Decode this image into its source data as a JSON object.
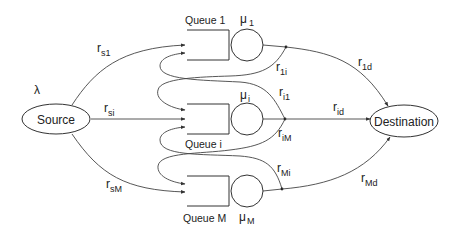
{
  "diagram": {
    "type": "queueing-network",
    "arrival_rate": {
      "symbol": "λ"
    },
    "nodes": {
      "source": {
        "label": "Source"
      },
      "destination": {
        "label": "Destination"
      }
    },
    "queues": [
      {
        "id": "1",
        "label": "Queue 1",
        "service_symbol": "μ",
        "service_sub": "1"
      },
      {
        "id": "i",
        "label": "Queue i",
        "service_symbol": "μ",
        "service_sub": "i"
      },
      {
        "id": "M",
        "label": "Queue M",
        "service_symbol": "μ",
        "service_sub": "M"
      }
    ],
    "edges": [
      {
        "from": "Source",
        "to": "Queue 1",
        "symbol": "r",
        "sub": "s1"
      },
      {
        "from": "Source",
        "to": "Queue i",
        "symbol": "r",
        "sub": "si"
      },
      {
        "from": "Source",
        "to": "Queue M",
        "symbol": "r",
        "sub": "sM"
      },
      {
        "from": "Queue 1",
        "to": "Queue i",
        "symbol": "r",
        "sub": "1i"
      },
      {
        "from": "Queue i",
        "to": "Queue 1",
        "symbol": "r",
        "sub": "i1"
      },
      {
        "from": "Queue i",
        "to": "Queue M",
        "symbol": "r",
        "sub": "iM"
      },
      {
        "from": "Queue M",
        "to": "Queue i",
        "symbol": "r",
        "sub": "Mi"
      },
      {
        "from": "Queue 1",
        "to": "Destination",
        "symbol": "r",
        "sub": "1d"
      },
      {
        "from": "Queue i",
        "to": "Destination",
        "symbol": "r",
        "sub": "id"
      },
      {
        "from": "Queue M",
        "to": "Destination",
        "symbol": "r",
        "sub": "Md"
      }
    ]
  }
}
